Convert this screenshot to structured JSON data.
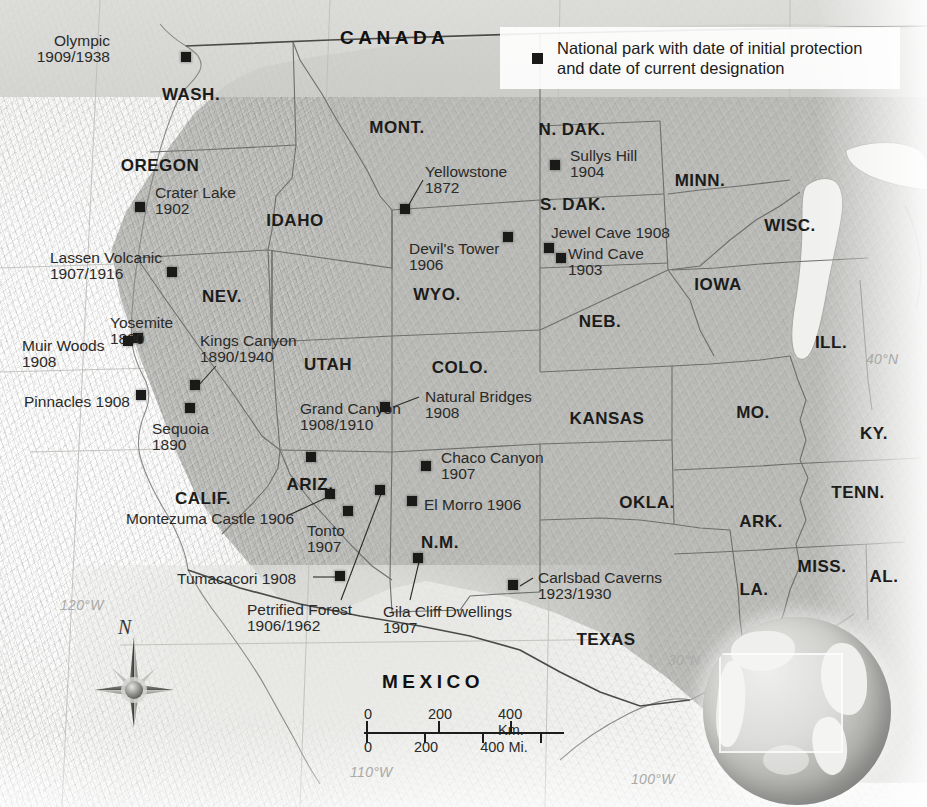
{
  "legend": {
    "line1": "National park with date of initial protection",
    "line2": "and date of current designation",
    "swatch_color": "#1a1a18"
  },
  "countries": [
    {
      "name": "CANADA",
      "x": 340,
      "y": 28
    },
    {
      "name": "MEXICO",
      "x": 382,
      "y": 672
    }
  ],
  "states": [
    {
      "name": "WASH.",
      "x": 191,
      "y": 86
    },
    {
      "name": "OREGON",
      "x": 160,
      "y": 157
    },
    {
      "name": "IDAHO",
      "x": 295,
      "y": 212
    },
    {
      "name": "MONT.",
      "x": 397,
      "y": 119
    },
    {
      "name": "N. DAK.",
      "x": 572,
      "y": 121
    },
    {
      "name": "S. DAK.",
      "x": 573,
      "y": 196
    },
    {
      "name": "MINN.",
      "x": 700,
      "y": 172
    },
    {
      "name": "WISC.",
      "x": 790,
      "y": 217
    },
    {
      "name": "NEV.",
      "x": 222,
      "y": 288
    },
    {
      "name": "WYO.",
      "x": 437,
      "y": 286
    },
    {
      "name": "NEB.",
      "x": 600,
      "y": 313
    },
    {
      "name": "IOWA",
      "x": 718,
      "y": 276
    },
    {
      "name": "ILL.",
      "x": 831,
      "y": 334
    },
    {
      "name": "UTAH",
      "x": 328,
      "y": 356
    },
    {
      "name": "COLO.",
      "x": 460,
      "y": 359
    },
    {
      "name": "KANSAS",
      "x": 607,
      "y": 410
    },
    {
      "name": "MO.",
      "x": 753,
      "y": 404
    },
    {
      "name": "KY.",
      "x": 874,
      "y": 425
    },
    {
      "name": "CALIF.",
      "x": 203,
      "y": 490
    },
    {
      "name": "ARIZ.",
      "x": 310,
      "y": 476
    },
    {
      "name": "N.M.",
      "x": 440,
      "y": 534
    },
    {
      "name": "OKLA.",
      "x": 647,
      "y": 494
    },
    {
      "name": "ARK.",
      "x": 761,
      "y": 513
    },
    {
      "name": "TENN.",
      "x": 858,
      "y": 484
    },
    {
      "name": "MISS.",
      "x": 822,
      "y": 558
    },
    {
      "name": "AL.",
      "x": 884,
      "y": 568
    },
    {
      "name": "LA.",
      "x": 754,
      "y": 581
    },
    {
      "name": "TEXAS",
      "x": 606,
      "y": 631
    }
  ],
  "graticule_labels": [
    {
      "text": "120°W",
      "x": 60,
      "y": 598
    },
    {
      "text": "110°W",
      "x": 350,
      "y": 765
    },
    {
      "text": "100°W",
      "x": 631,
      "y": 772
    },
    {
      "text": "40°N",
      "x": 866,
      "y": 352
    },
    {
      "text": "30°N",
      "x": 668,
      "y": 653
    }
  ],
  "parks": [
    {
      "name": "Olympic",
      "dates": "1909/1938",
      "lx": 110,
      "ly": 33,
      "align": "right",
      "mx": 186,
      "my": 57,
      "leader": null
    },
    {
      "name": "Crater Lake",
      "dates": "1902",
      "lx": 155,
      "ly": 185,
      "align": "left",
      "mx": 140,
      "my": 207,
      "leader": null
    },
    {
      "name": "Lassen Volcanic",
      "dates": "1907/1916",
      "lx": 50,
      "ly": 250,
      "align": "left",
      "mx": 172,
      "my": 272,
      "leader": null
    },
    {
      "name": "Yosemite",
      "dates": "1890",
      "lx": 110,
      "ly": 315,
      "align": "left",
      "mx": 138,
      "my": 338,
      "leader": null
    },
    {
      "name": "Muir Woods",
      "dates": "1908",
      "lx": 22,
      "ly": 338,
      "align": "left",
      "mx": 128,
      "my": 341,
      "leader": null
    },
    {
      "name": "Pinnacles 1908",
      "dates": "",
      "lx": 24,
      "ly": 394,
      "align": "left",
      "mx": 141,
      "my": 395,
      "leader": null
    },
    {
      "name": "Sequoia",
      "dates": "1890",
      "lx": 152,
      "ly": 421,
      "align": "left",
      "mx": 190,
      "my": 408,
      "leader": null
    },
    {
      "name": "Kings Canyon",
      "dates": "1890/1940",
      "lx": 200,
      "ly": 333,
      "align": "left",
      "mx": 195,
      "my": 385,
      "leader": [
        216,
        366,
        198,
        386
      ]
    },
    {
      "name": "Yellowstone",
      "dates": "1872",
      "lx": 425,
      "ly": 164,
      "align": "left",
      "mx": 405,
      "my": 209,
      "leader": [
        423,
        180,
        407,
        208
      ]
    },
    {
      "name": "Devil's Tower",
      "dates": "1906",
      "lx": 409,
      "ly": 241,
      "align": "left",
      "mx": 508,
      "my": 237,
      "leader": null
    },
    {
      "name": "Sullys Hill",
      "dates": "1904",
      "lx": 570,
      "ly": 148,
      "align": "left",
      "mx": 555,
      "my": 165,
      "leader": null
    },
    {
      "name": "Jewel Cave 1908",
      "dates": "",
      "lx": 551,
      "ly": 225,
      "align": "left",
      "mx": 549,
      "my": 248,
      "leader": null
    },
    {
      "name": "Wind Cave",
      "dates": "1903",
      "lx": 568,
      "ly": 246,
      "align": "left",
      "mx": 561,
      "my": 258,
      "leader": null
    },
    {
      "name": "Grand Canyon",
      "dates": "1908/1910",
      "lx": 300,
      "ly": 401,
      "align": "left",
      "mx": 311,
      "my": 457,
      "leader": null
    },
    {
      "name": "Natural Bridges",
      "dates": "1908",
      "lx": 425,
      "ly": 389,
      "align": "left",
      "mx": 385,
      "my": 407,
      "leader": [
        419,
        397,
        393,
        407
      ]
    },
    {
      "name": "Chaco Canyon",
      "dates": "1907",
      "lx": 441,
      "ly": 450,
      "align": "left",
      "mx": 426,
      "my": 466,
      "leader": null
    },
    {
      "name": "El Morro 1906",
      "dates": "",
      "lx": 424,
      "ly": 497,
      "align": "left",
      "mx": 412,
      "my": 501,
      "leader": null
    },
    {
      "name": "Montezuma Castle 1906",
      "dates": "",
      "lx": 126,
      "ly": 511,
      "align": "left",
      "mx": 330,
      "my": 494,
      "leader": [
        289,
        515,
        328,
        497
      ]
    },
    {
      "name": "Tonto",
      "dates": "1907",
      "lx": 307,
      "ly": 523,
      "align": "left",
      "mx": 348,
      "my": 511,
      "leader": null
    },
    {
      "name": "Tumacacori 1908",
      "dates": "",
      "lx": 177,
      "ly": 571,
      "align": "left",
      "mx": 340,
      "my": 576,
      "leader": [
        313,
        577,
        337,
        577
      ]
    },
    {
      "name": "Petrified Forest",
      "dates": "1906/1962",
      "lx": 247,
      "ly": 602,
      "align": "left",
      "mx": 380,
      "my": 490,
      "leader": [
        341,
        600,
        381,
        494
      ]
    },
    {
      "name": "Gila Cliff Dwellings",
      "dates": "1907",
      "lx": 383,
      "ly": 604,
      "align": "left",
      "mx": 418,
      "my": 558,
      "leader": [
        410,
        600,
        419,
        562
      ]
    },
    {
      "name": "Carlsbad Caverns",
      "dates": "1923/1930",
      "lx": 538,
      "ly": 570,
      "align": "left",
      "mx": 513,
      "my": 585,
      "leader": [
        533,
        578,
        520,
        586
      ]
    }
  ],
  "scale": {
    "km": {
      "t0": "0",
      "t1": "200",
      "t2": "400 Km."
    },
    "mi": {
      "t0": "0",
      "t1": "200",
      "t2": "400 Mi."
    }
  },
  "compass": {
    "north_label": "N"
  }
}
